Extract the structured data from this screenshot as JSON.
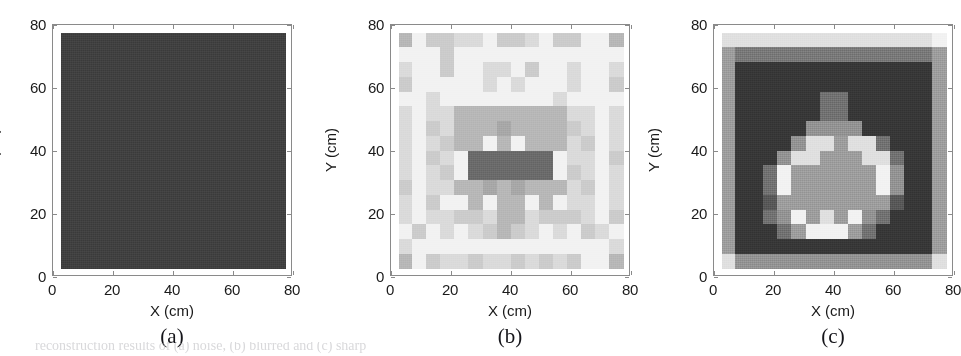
{
  "figure": {
    "background": "#ffffff",
    "bottom_caption_remnant": "reconstruction results of (a) noise, (b) blurred and (c) sharp"
  },
  "axis": {
    "x_title": "X (cm)",
    "y_title": "Y (cm)",
    "x_ticks": [
      "0",
      "20",
      "40",
      "60",
      "80"
    ],
    "y_ticks": [
      "0",
      "20",
      "40",
      "60",
      "80"
    ],
    "x_tick_values": [
      0,
      20,
      40,
      60,
      80
    ],
    "y_tick_values": [
      0,
      20,
      40,
      60,
      80
    ],
    "xlim": [
      0,
      80
    ],
    "ylim": [
      0,
      80
    ],
    "units": "cm"
  },
  "panels": [
    {
      "id": "a",
      "label": "(a)"
    },
    {
      "id": "b",
      "label": "(b)"
    },
    {
      "id": "c",
      "label": "(c)"
    }
  ],
  "palette": {
    "axis_line": "#8a8a8a",
    "text": "#1a1a1a",
    "label_text": "#15151a",
    "panel_a_fill": "#414141",
    "darkest": "#3a3a3a",
    "white": "#ffffff"
  },
  "chart_data": [
    {
      "type": "heatmap",
      "panel": "a",
      "title": "(a)",
      "xlabel": "X (cm)",
      "ylabel": "Y (cm)",
      "xlim": [
        0,
        80
      ],
      "ylim": [
        0,
        80
      ],
      "grid": false,
      "legend": "none",
      "description": "Uniform dark-gray noise field covering the full domain; no structure visible.",
      "nx": 1,
      "ny": 1,
      "extent": [
        2.5,
        77.5,
        2.5,
        77.5
      ],
      "vmin": 0,
      "vmax": 1,
      "colormap": "gray",
      "values": [
        [
          0.255
        ]
      ]
    },
    {
      "type": "heatmap",
      "panel": "b",
      "title": "(b)",
      "xlabel": "X (cm)",
      "ylabel": "Y (cm)",
      "xlim": [
        0,
        80
      ],
      "ylim": [
        0,
        80
      ],
      "grid": false,
      "legend": "none",
      "description": "Blocky low-resolution reconstruction on a 16x16 grid; mostly light background with a dark central cluster peaking near (40,37).",
      "nx": 16,
      "ny": 16,
      "extent": [
        2.5,
        77.5,
        2.5,
        77.5
      ],
      "vmin": 0,
      "vmax": 1,
      "colormap": "gray",
      "row_order": "top_to_bottom",
      "values": [
        [
          0.72,
          0.95,
          0.8,
          0.8,
          0.86,
          0.86,
          0.95,
          0.8,
          0.8,
          0.86,
          0.95,
          0.8,
          0.8,
          0.95,
          0.95,
          0.72
        ],
        [
          0.95,
          0.95,
          0.95,
          0.8,
          0.95,
          0.95,
          0.95,
          0.95,
          0.95,
          0.95,
          0.95,
          0.95,
          0.95,
          0.95,
          0.95,
          0.95
        ],
        [
          0.86,
          0.95,
          0.95,
          0.8,
          0.95,
          0.95,
          0.86,
          0.86,
          0.95,
          0.8,
          0.95,
          0.95,
          0.86,
          0.95,
          0.95,
          0.86
        ],
        [
          0.8,
          0.95,
          0.95,
          0.95,
          0.95,
          0.95,
          0.86,
          0.95,
          0.86,
          0.95,
          0.95,
          0.95,
          0.86,
          0.95,
          0.95,
          0.8
        ],
        [
          0.95,
          0.95,
          0.86,
          0.95,
          0.95,
          0.95,
          0.95,
          0.95,
          0.95,
          0.95,
          0.95,
          0.86,
          0.95,
          0.95,
          0.95,
          0.95
        ],
        [
          0.86,
          0.95,
          0.86,
          0.86,
          0.72,
          0.72,
          0.72,
          0.72,
          0.72,
          0.72,
          0.72,
          0.72,
          0.86,
          0.86,
          0.95,
          0.86
        ],
        [
          0.86,
          0.95,
          0.8,
          0.86,
          0.72,
          0.72,
          0.72,
          0.66,
          0.72,
          0.72,
          0.72,
          0.72,
          0.8,
          0.86,
          0.95,
          0.86
        ],
        [
          0.86,
          0.95,
          0.86,
          0.8,
          0.72,
          0.72,
          0.95,
          0.72,
          0.95,
          0.72,
          0.72,
          0.72,
          0.86,
          0.8,
          0.95,
          0.86
        ],
        [
          0.86,
          0.95,
          0.8,
          0.86,
          0.95,
          0.42,
          0.42,
          0.42,
          0.42,
          0.42,
          0.42,
          0.95,
          0.86,
          0.86,
          0.95,
          0.8
        ],
        [
          0.86,
          0.95,
          0.86,
          0.8,
          0.95,
          0.42,
          0.42,
          0.42,
          0.42,
          0.42,
          0.42,
          0.95,
          0.8,
          0.86,
          0.95,
          0.86
        ],
        [
          0.8,
          0.95,
          0.86,
          0.86,
          0.72,
          0.72,
          0.66,
          0.72,
          0.66,
          0.72,
          0.72,
          0.72,
          0.86,
          0.8,
          0.95,
          0.86
        ],
        [
          0.86,
          0.95,
          0.8,
          0.95,
          0.95,
          0.72,
          0.95,
          0.72,
          0.72,
          0.95,
          0.72,
          0.95,
          0.86,
          0.86,
          0.95,
          0.86
        ],
        [
          0.86,
          0.95,
          0.86,
          0.86,
          0.8,
          0.8,
          0.86,
          0.72,
          0.72,
          0.86,
          0.8,
          0.8,
          0.8,
          0.86,
          0.95,
          0.8
        ],
        [
          0.95,
          0.8,
          0.95,
          0.86,
          0.95,
          0.86,
          0.8,
          0.72,
          0.8,
          0.86,
          0.95,
          0.86,
          0.95,
          0.8,
          0.86,
          0.95
        ],
        [
          0.86,
          0.95,
          0.95,
          0.95,
          0.95,
          0.95,
          0.95,
          0.95,
          0.95,
          0.95,
          0.95,
          0.95,
          0.95,
          0.95,
          0.95,
          0.86
        ],
        [
          0.72,
          0.95,
          0.8,
          0.86,
          0.86,
          0.8,
          0.86,
          0.86,
          0.8,
          0.86,
          0.8,
          0.86,
          0.8,
          0.95,
          0.95,
          0.72
        ]
      ]
    },
    {
      "type": "heatmap",
      "panel": "c",
      "title": "(c)",
      "xlabel": "X (cm)",
      "ylabel": "Y (cm)",
      "xlim": [
        0,
        80
      ],
      "ylim": [
        0,
        80
      ],
      "grid": false,
      "legend": "none",
      "description": "High-contrast reconstruction: light outer frame, dark background, and a bright round object centred near (42,35) with a white rim and a small gray tab above it.",
      "nx": 16,
      "ny": 16,
      "extent": [
        2.5,
        77.5,
        2.5,
        77.5
      ],
      "vmin": 0,
      "vmax": 1,
      "colormap": "gray",
      "row_order": "top_to_bottom",
      "values": [
        [
          0.88,
          0.88,
          0.88,
          0.88,
          0.88,
          0.88,
          0.88,
          0.88,
          0.88,
          0.88,
          0.88,
          0.88,
          0.88,
          0.88,
          0.88,
          0.95
        ],
        [
          0.62,
          0.48,
          0.48,
          0.48,
          0.48,
          0.48,
          0.48,
          0.48,
          0.48,
          0.48,
          0.48,
          0.48,
          0.48,
          0.48,
          0.48,
          0.62
        ],
        [
          0.62,
          0.22,
          0.22,
          0.22,
          0.22,
          0.22,
          0.22,
          0.22,
          0.22,
          0.22,
          0.22,
          0.22,
          0.22,
          0.22,
          0.22,
          0.62
        ],
        [
          0.62,
          0.22,
          0.22,
          0.22,
          0.22,
          0.22,
          0.22,
          0.22,
          0.22,
          0.22,
          0.22,
          0.22,
          0.22,
          0.22,
          0.22,
          0.62
        ],
        [
          0.62,
          0.22,
          0.22,
          0.22,
          0.22,
          0.22,
          0.22,
          0.45,
          0.45,
          0.22,
          0.22,
          0.22,
          0.22,
          0.22,
          0.22,
          0.62
        ],
        [
          0.62,
          0.22,
          0.22,
          0.22,
          0.22,
          0.22,
          0.22,
          0.45,
          0.45,
          0.22,
          0.22,
          0.22,
          0.22,
          0.22,
          0.22,
          0.62
        ],
        [
          0.62,
          0.22,
          0.22,
          0.22,
          0.22,
          0.22,
          0.58,
          0.58,
          0.58,
          0.58,
          0.22,
          0.22,
          0.22,
          0.22,
          0.22,
          0.62
        ],
        [
          0.62,
          0.22,
          0.22,
          0.22,
          0.22,
          0.58,
          0.88,
          0.88,
          0.62,
          0.88,
          0.88,
          0.45,
          0.22,
          0.22,
          0.22,
          0.62
        ],
        [
          0.62,
          0.22,
          0.22,
          0.22,
          0.58,
          0.88,
          0.88,
          0.62,
          0.62,
          0.62,
          0.88,
          0.88,
          0.45,
          0.22,
          0.22,
          0.62
        ],
        [
          0.62,
          0.22,
          0.22,
          0.45,
          0.95,
          0.62,
          0.62,
          0.62,
          0.62,
          0.62,
          0.62,
          0.95,
          0.58,
          0.22,
          0.22,
          0.62
        ],
        [
          0.62,
          0.22,
          0.22,
          0.45,
          0.95,
          0.62,
          0.62,
          0.62,
          0.62,
          0.62,
          0.62,
          0.95,
          0.58,
          0.22,
          0.22,
          0.62
        ],
        [
          0.62,
          0.22,
          0.22,
          0.35,
          0.62,
          0.62,
          0.62,
          0.62,
          0.62,
          0.62,
          0.62,
          0.62,
          0.35,
          0.22,
          0.22,
          0.62
        ],
        [
          0.62,
          0.22,
          0.22,
          0.45,
          0.58,
          0.95,
          0.62,
          0.88,
          0.62,
          0.95,
          0.58,
          0.45,
          0.22,
          0.22,
          0.22,
          0.62
        ],
        [
          0.62,
          0.22,
          0.22,
          0.22,
          0.45,
          0.62,
          0.95,
          0.95,
          0.95,
          0.62,
          0.45,
          0.22,
          0.22,
          0.22,
          0.22,
          0.62
        ],
        [
          0.62,
          0.22,
          0.22,
          0.22,
          0.22,
          0.22,
          0.22,
          0.22,
          0.22,
          0.22,
          0.22,
          0.22,
          0.22,
          0.22,
          0.22,
          0.62
        ],
        [
          0.88,
          0.58,
          0.58,
          0.58,
          0.58,
          0.58,
          0.58,
          0.58,
          0.58,
          0.58,
          0.58,
          0.58,
          0.58,
          0.58,
          0.58,
          0.88
        ]
      ]
    }
  ]
}
